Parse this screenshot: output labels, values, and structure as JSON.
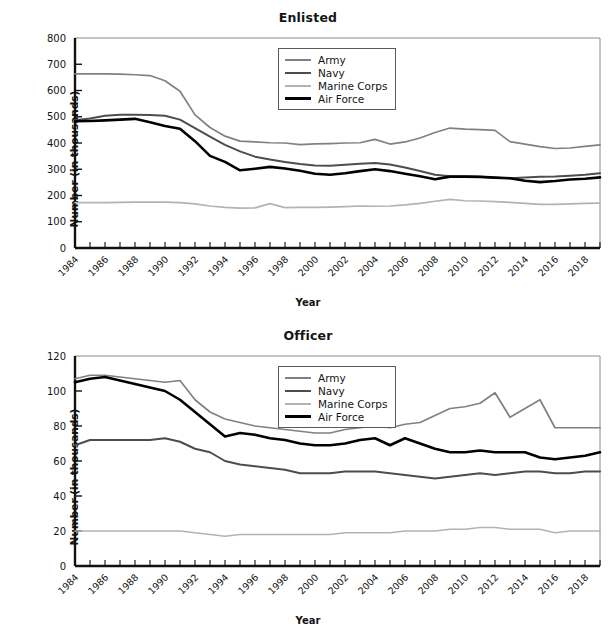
{
  "figure": {
    "x_axis_label": "Year",
    "y_axis_label": "Number (in thousands)",
    "series_colors": {
      "army": "#808080",
      "navy": "#4d4d4d",
      "marine_corps": "#b3b3b3",
      "air_force": "#000000"
    },
    "legend_labels": {
      "army": "Army",
      "navy": "Navy",
      "marine_corps": "Marine Corps",
      "air_force": "Air Force"
    }
  },
  "chart_data": [
    {
      "type": "line",
      "title": "Enlisted",
      "xlabel": "Year",
      "ylabel": "Number (in thousands)",
      "xlim": [
        1984,
        2019
      ],
      "ylim": [
        0,
        800
      ],
      "ytick_labels": [
        "0",
        "100",
        "200",
        "300",
        "400",
        "500",
        "600",
        "700",
        "800"
      ],
      "yticks": [
        0,
        100,
        200,
        300,
        400,
        500,
        600,
        700,
        800
      ],
      "xtick_labels": [
        "1984",
        "1986",
        "1988",
        "1990",
        "1992",
        "1994",
        "1996",
        "1998",
        "2000",
        "2002",
        "2004",
        "2006",
        "2008",
        "2010",
        "2012",
        "2014",
        "2016",
        "2018"
      ],
      "xticks": [
        1984,
        1986,
        1988,
        1990,
        1992,
        1994,
        1996,
        1998,
        2000,
        2002,
        2004,
        2006,
        2008,
        2010,
        2012,
        2014,
        2016,
        2018
      ],
      "grid": false,
      "legend_position": "upper center",
      "x": [
        1984,
        1985,
        1986,
        1987,
        1988,
        1989,
        1990,
        1991,
        1992,
        1993,
        1994,
        1995,
        1996,
        1997,
        1998,
        1999,
        2000,
        2001,
        2002,
        2003,
        2004,
        2005,
        2006,
        2007,
        2008,
        2009,
        2010,
        2011,
        2012,
        2013,
        2014,
        2015,
        2016,
        2017,
        2018,
        2019
      ],
      "series": [
        {
          "name": "Army",
          "color": "#808080",
          "values": [
            663,
            663,
            663,
            662,
            660,
            657,
            637,
            597,
            507,
            459,
            426,
            407,
            404,
            401,
            400,
            394,
            397,
            398,
            400,
            401,
            414,
            396,
            404,
            419,
            440,
            457,
            453,
            451,
            448,
            405,
            396,
            386,
            379,
            381,
            387,
            393
          ]
        },
        {
          "name": "Navy",
          "color": "#4d4d4d",
          "values": [
            487,
            493,
            504,
            508,
            508,
            507,
            504,
            489,
            457,
            424,
            393,
            368,
            348,
            337,
            328,
            320,
            314,
            313,
            317,
            321,
            324,
            318,
            307,
            293,
            279,
            273,
            272,
            271,
            268,
            266,
            269,
            271,
            272,
            275,
            279,
            285
          ]
        },
        {
          "name": "Marine Corps",
          "color": "#b3b3b3",
          "values": [
            173,
            173,
            173,
            174,
            175,
            175,
            175,
            173,
            168,
            160,
            155,
            152,
            153,
            169,
            154,
            155,
            155,
            156,
            158,
            160,
            159,
            160,
            164,
            170,
            178,
            185,
            180,
            179,
            177,
            174,
            170,
            166,
            166,
            168,
            170,
            171
          ]
        },
        {
          "name": "Air Force",
          "color": "#000000",
          "values": [
            483,
            484,
            486,
            489,
            492,
            479,
            465,
            454,
            407,
            351,
            328,
            296,
            302,
            309,
            303,
            294,
            283,
            279,
            285,
            293,
            300,
            293,
            283,
            273,
            262,
            272,
            272,
            271,
            268,
            266,
            256,
            251,
            255,
            261,
            264,
            269
          ]
        }
      ]
    },
    {
      "type": "line",
      "title": "Officer",
      "xlabel": "Year",
      "ylabel": "Number (in thousands)",
      "xlim": [
        1984,
        2019
      ],
      "ylim": [
        0,
        120
      ],
      "ytick_labels": [
        "0",
        "20",
        "40",
        "60",
        "80",
        "100",
        "120"
      ],
      "yticks": [
        0,
        20,
        40,
        60,
        80,
        100,
        120
      ],
      "xtick_labels": [
        "1984",
        "1986",
        "1988",
        "1990",
        "1992",
        "1994",
        "1996",
        "1998",
        "2000",
        "2002",
        "2004",
        "2006",
        "2008",
        "2010",
        "2012",
        "2014",
        "2016",
        "2018"
      ],
      "xticks": [
        1984,
        1986,
        1988,
        1990,
        1992,
        1994,
        1996,
        1998,
        2000,
        2002,
        2004,
        2006,
        2008,
        2010,
        2012,
        2014,
        2016,
        2018
      ],
      "grid": false,
      "legend_position": "upper center",
      "x": [
        1984,
        1985,
        1986,
        1987,
        1988,
        1989,
        1990,
        1991,
        1992,
        1993,
        1994,
        1995,
        1996,
        1997,
        1998,
        1999,
        2000,
        2001,
        2002,
        2003,
        2004,
        2005,
        2006,
        2007,
        2008,
        2009,
        2010,
        2011,
        2012,
        2013,
        2014,
        2015,
        2016,
        2017,
        2018,
        2019
      ],
      "series": [
        {
          "name": "Army",
          "color": "#808080",
          "values": [
            107,
            109,
            109,
            108,
            107,
            106,
            105,
            106,
            95,
            88,
            84,
            82,
            80,
            79,
            78,
            77,
            76,
            76,
            78,
            79,
            80,
            79,
            81,
            82,
            86,
            90,
            91,
            93,
            99,
            85,
            90,
            95,
            79,
            79,
            79,
            79
          ]
        },
        {
          "name": "Navy",
          "color": "#4d4d4d",
          "values": [
            69,
            72,
            72,
            72,
            72,
            72,
            73,
            71,
            67,
            65,
            60,
            58,
            57,
            56,
            55,
            53,
            53,
            53,
            54,
            54,
            54,
            53,
            52,
            51,
            50,
            51,
            52,
            53,
            52,
            53,
            54,
            54,
            53,
            53,
            54,
            54
          ]
        },
        {
          "name": "Marine Corps",
          "color": "#b3b3b3",
          "values": [
            20,
            20,
            20,
            20,
            20,
            20,
            20,
            20,
            19,
            18,
            17,
            18,
            18,
            18,
            18,
            18,
            18,
            18,
            19,
            19,
            19,
            19,
            20,
            20,
            20,
            21,
            21,
            22,
            22,
            21,
            21,
            21,
            19,
            20,
            20,
            20
          ]
        },
        {
          "name": "Air Force",
          "color": "#000000",
          "values": [
            105,
            107,
            108,
            106,
            104,
            102,
            100,
            95,
            88,
            81,
            74,
            76,
            75,
            73,
            72,
            70,
            69,
            69,
            70,
            72,
            73,
            69,
            73,
            70,
            67,
            65,
            65,
            66,
            65,
            65,
            65,
            62,
            61,
            62,
            63,
            65
          ]
        }
      ]
    }
  ]
}
